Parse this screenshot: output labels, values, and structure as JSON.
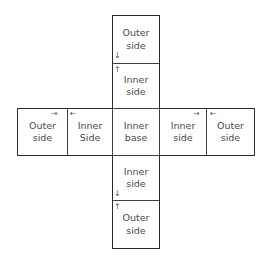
{
  "diagram": {
    "type": "cross-net",
    "panels": {
      "top_outer": {
        "line1": "Outer",
        "line2": "side"
      },
      "top_inner": {
        "line1": "Inner",
        "line2": "side"
      },
      "left_outer": {
        "line1": "Outer",
        "line2": "side"
      },
      "left_inner": {
        "line1": "Inner",
        "line2": "Side"
      },
      "center": {
        "line1": "Inner",
        "line2": "base"
      },
      "right_inner": {
        "line1": "Inner",
        "line2": "side"
      },
      "right_outer": {
        "line1": "Outer",
        "line2": "side"
      },
      "bottom_inner": {
        "line1": "Inner",
        "line2": "side"
      },
      "bottom_outer": {
        "line1": "Outer",
        "line2": "side"
      }
    },
    "arrows": {
      "down": "↓",
      "up": "↑",
      "right": "→",
      "left": "←"
    },
    "colors": {
      "stroke": "#2a2a2a",
      "text": "#4a4a4a",
      "background": "#ffffff"
    }
  }
}
